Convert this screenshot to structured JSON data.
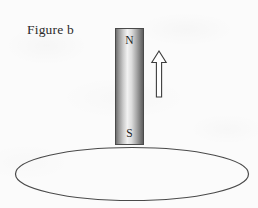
{
  "figure": {
    "caption": "Figure b",
    "background_color": "#fbfbfb",
    "ink_color": "#2b2b2b"
  },
  "magnet": {
    "name": "bar-magnet",
    "north_pole_label": "N",
    "south_pole_label": "S",
    "orientation": "vertical",
    "north_pole_position": "top",
    "south_pole_position": "bottom",
    "outline_color": "#4a4a4a",
    "gradient_light": "#f2f2f2",
    "gradient_dark": "#5e5e5e"
  },
  "arrow": {
    "name": "motion-arrow",
    "direction": "up",
    "style": "hollow-outline",
    "stroke_color": "#3d3d3d",
    "fill_color": "#ffffff"
  },
  "loop": {
    "name": "conducting-loop",
    "shape": "ellipse",
    "stroke_color": "#4a4a4a",
    "fill": "none"
  }
}
